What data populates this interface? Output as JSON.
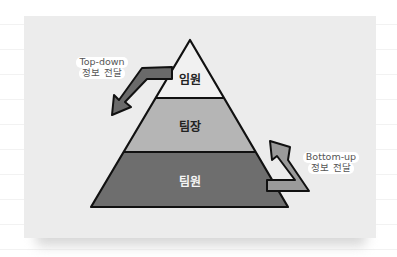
{
  "diagram": {
    "type": "hierarchy-pyramid",
    "tiers": [
      {
        "label": "임원",
        "fill": "#f1f1f1",
        "text_color": "#222222"
      },
      {
        "label": "팀장",
        "fill": "#b5b5b5",
        "text_color": "#222222"
      },
      {
        "label": "팀원",
        "fill": "#6e6e6e",
        "text_color": "#f5f5f5"
      }
    ],
    "arrows": [
      {
        "direction": "down",
        "line1": "Top-down",
        "line2": "정보 전달"
      },
      {
        "direction": "up",
        "line1": "Bottom-up",
        "line2": "정보 전달"
      }
    ],
    "colors": {
      "card_bg": "#ececec",
      "outline": "#111111",
      "arrow_down_fill": "#6a6a6a",
      "arrow_up_fill": "#9a9a9a"
    }
  }
}
